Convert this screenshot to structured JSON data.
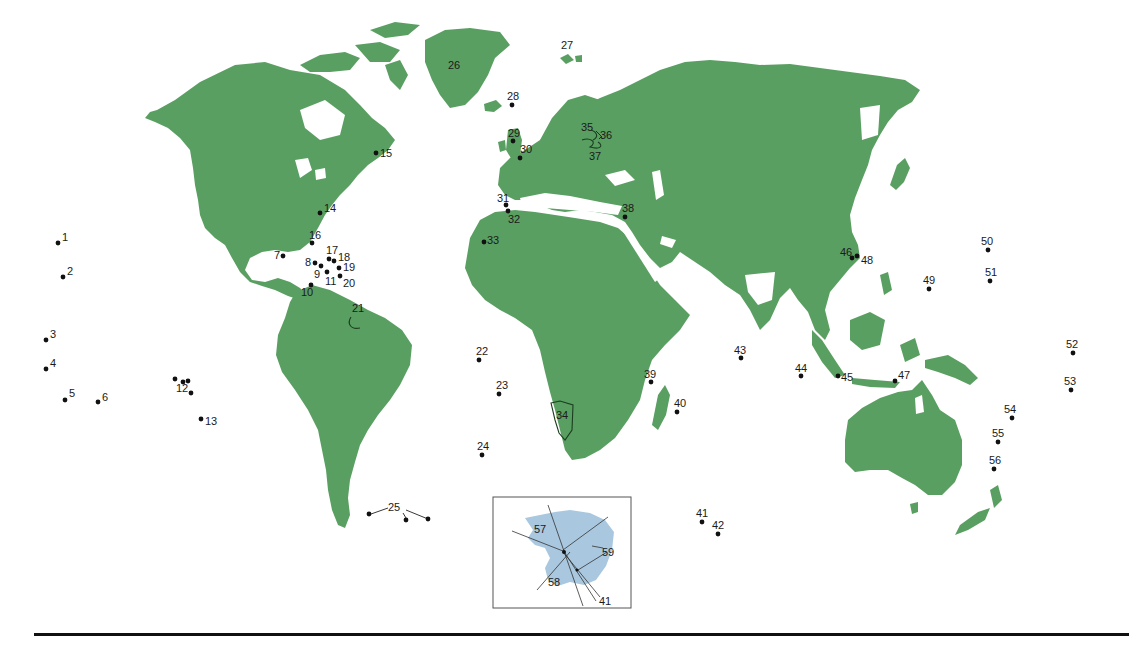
{
  "figure": {
    "type": "world-map-with-numbered-locations",
    "colors": {
      "land": "#5a9f62",
      "ocean": "#ffffff",
      "antarctica_inset": "#a9c8e0",
      "markers": "#111111",
      "rule": "#111111"
    }
  },
  "markers": [
    {
      "n": "1",
      "x": 58,
      "y": 243
    },
    {
      "n": "2",
      "x": 63,
      "y": 277
    },
    {
      "n": "3",
      "x": 46,
      "y": 340
    },
    {
      "n": "4",
      "x": 46,
      "y": 369
    },
    {
      "n": "5",
      "x": 65,
      "y": 400
    },
    {
      "n": "6",
      "x": 98,
      "y": 402
    },
    {
      "n": "7",
      "x": 283,
      "y": 256
    },
    {
      "n": "8",
      "x": 315,
      "y": 263
    },
    {
      "n": "9",
      "x": 321,
      "y": 266
    },
    {
      "n": "10",
      "x": 311,
      "y": 285
    },
    {
      "n": "11",
      "x": 327,
      "y": 272
    },
    {
      "n": "12",
      "x": 183,
      "y": 382
    },
    {
      "n": "13",
      "x": 201,
      "y": 419
    },
    {
      "n": "14",
      "x": 320,
      "y": 213
    },
    {
      "n": "15",
      "x": 376,
      "y": 153
    },
    {
      "n": "16",
      "x": 312,
      "y": 243
    },
    {
      "n": "17",
      "x": 329,
      "y": 259
    },
    {
      "n": "18",
      "x": 334,
      "y": 261
    },
    {
      "n": "19",
      "x": 339,
      "y": 268
    },
    {
      "n": "20",
      "x": 340,
      "y": 276
    },
    {
      "n": "21",
      "x": 352,
      "y": 320
    },
    {
      "n": "22",
      "x": 479,
      "y": 360
    },
    {
      "n": "23",
      "x": 499,
      "y": 394
    },
    {
      "n": "24",
      "x": 482,
      "y": 455
    },
    {
      "n": "25",
      "x": 396,
      "y": 507
    },
    {
      "n": "26",
      "x": 456,
      "y": 65
    },
    {
      "n": "27",
      "x": 568,
      "y": 45
    },
    {
      "n": "28",
      "x": 512,
      "y": 105
    },
    {
      "n": "29",
      "x": 513,
      "y": 141
    },
    {
      "n": "30",
      "x": 520,
      "y": 158
    },
    {
      "n": "31",
      "x": 506,
      "y": 205
    },
    {
      "n": "32",
      "x": 508,
      "y": 211
    },
    {
      "n": "33",
      "x": 484,
      "y": 242
    },
    {
      "n": "34",
      "x": 564,
      "y": 415
    },
    {
      "n": "35",
      "x": 589,
      "y": 127
    },
    {
      "n": "36",
      "x": 603,
      "y": 135
    },
    {
      "n": "37",
      "x": 595,
      "y": 150
    },
    {
      "n": "38",
      "x": 625,
      "y": 217
    },
    {
      "n": "39",
      "x": 651,
      "y": 382
    },
    {
      "n": "40",
      "x": 677,
      "y": 412
    },
    {
      "n": "41",
      "x": 702,
      "y": 522
    },
    {
      "n": "42",
      "x": 718,
      "y": 534
    },
    {
      "n": "43",
      "x": 741,
      "y": 358
    },
    {
      "n": "44",
      "x": 801,
      "y": 376
    },
    {
      "n": "45",
      "x": 838,
      "y": 376
    },
    {
      "n": "46",
      "x": 852,
      "y": 258
    },
    {
      "n": "47",
      "x": 895,
      "y": 381
    },
    {
      "n": "48",
      "x": 857,
      "y": 256
    },
    {
      "n": "49",
      "x": 929,
      "y": 289
    },
    {
      "n": "50",
      "x": 988,
      "y": 250
    },
    {
      "n": "51",
      "x": 990,
      "y": 281
    },
    {
      "n": "52",
      "x": 1073,
      "y": 353
    },
    {
      "n": "53",
      "x": 1071,
      "y": 390
    },
    {
      "n": "54",
      "x": 1012,
      "y": 418
    },
    {
      "n": "55",
      "x": 998,
      "y": 442
    },
    {
      "n": "56",
      "x": 994,
      "y": 469
    }
  ],
  "inset": {
    "title": "Antarctica",
    "labels": [
      {
        "n": "57",
        "x": 542,
        "y": 529
      },
      {
        "n": "58",
        "x": 556,
        "y": 582
      },
      {
        "n": "59",
        "x": 610,
        "y": 552
      },
      {
        "n": "41",
        "x": 607,
        "y": 601
      }
    ]
  }
}
